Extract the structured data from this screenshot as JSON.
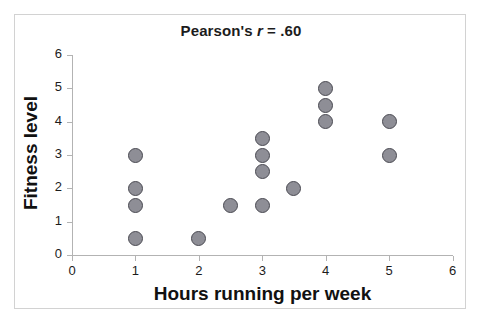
{
  "chart_data": {
    "type": "scatter",
    "title": "Pearson's r = .60",
    "title_prefix": "Pearson's ",
    "title_symbol": "r",
    "title_suffix": " = .60",
    "xlabel": "Hours running per week",
    "ylabel": "Fitness level",
    "xlim": [
      0,
      6
    ],
    "ylim": [
      0,
      6
    ],
    "xticks": [
      "0",
      "1",
      "2",
      "3",
      "4",
      "5",
      "6"
    ],
    "yticks": [
      "0",
      "1",
      "2",
      "3",
      "4",
      "5",
      "6"
    ],
    "xtick_values": [
      0,
      1,
      2,
      3,
      4,
      5,
      6
    ],
    "ytick_values": [
      0,
      1,
      2,
      3,
      4,
      5,
      6
    ],
    "grid": false,
    "legend": "none",
    "marker": {
      "shape": "circle",
      "fill_color": "#8e8e96",
      "edge_color": "#4a4a52",
      "size_px": 15
    },
    "frame_color": "#d2d2d2",
    "axis_color": "#b3b3b3",
    "n_points": 17,
    "points": [
      {
        "x": 1,
        "y": 3
      },
      {
        "x": 1,
        "y": 2
      },
      {
        "x": 1,
        "y": 1.5
      },
      {
        "x": 1,
        "y": 0.5
      },
      {
        "x": 2,
        "y": 0.5
      },
      {
        "x": 2.5,
        "y": 1.5
      },
      {
        "x": 3,
        "y": 3.5
      },
      {
        "x": 3,
        "y": 3
      },
      {
        "x": 3,
        "y": 2.5
      },
      {
        "x": 3,
        "y": 1.5
      },
      {
        "x": 3.5,
        "y": 2
      },
      {
        "x": 4,
        "y": 5
      },
      {
        "x": 4,
        "y": 4.5
      },
      {
        "x": 4,
        "y": 4
      },
      {
        "x": 5,
        "y": 4
      },
      {
        "x": 5,
        "y": 3
      }
    ]
  }
}
